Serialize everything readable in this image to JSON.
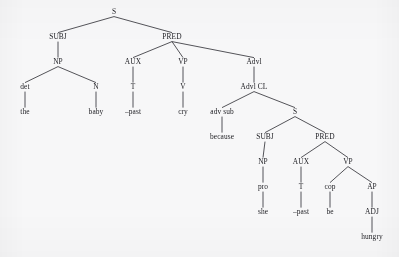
{
  "diagram": {
    "type": "constituency-tree",
    "background_color": "#f7f7f8",
    "line_color": "#2a2a30",
    "text_color": "#1d1d22",
    "width": 399,
    "height": 257,
    "nodes": [
      {
        "id": "s-main",
        "label": "S",
        "kind": "category",
        "x": 114,
        "y": 14
      },
      {
        "id": "subj-main",
        "label": "SUBJ",
        "kind": "category",
        "x": 58,
        "y": 39
      },
      {
        "id": "pred-main",
        "label": "PRED",
        "kind": "category",
        "x": 172,
        "y": 39
      },
      {
        "id": "np-main",
        "label": "NP",
        "kind": "category",
        "x": 58,
        "y": 64
      },
      {
        "id": "aux-main",
        "label": "AUX",
        "kind": "category",
        "x": 133,
        "y": 64
      },
      {
        "id": "vp-main",
        "label": "VP",
        "kind": "category",
        "x": 183,
        "y": 64
      },
      {
        "id": "advl-main",
        "label": "Advl",
        "kind": "category",
        "x": 254,
        "y": 64
      },
      {
        "id": "det-main",
        "label": "det",
        "kind": "category",
        "x": 25,
        "y": 89
      },
      {
        "id": "n-main",
        "label": "N",
        "kind": "category",
        "x": 96,
        "y": 89
      },
      {
        "id": "t-main",
        "label": "T",
        "kind": "category",
        "x": 133,
        "y": 89
      },
      {
        "id": "v-main",
        "label": "V",
        "kind": "category",
        "x": 183,
        "y": 89
      },
      {
        "id": "advlcl",
        "label": "Advl CL",
        "kind": "category",
        "x": 254,
        "y": 89
      },
      {
        "id": "the",
        "label": "the",
        "kind": "lexical",
        "x": 25,
        "y": 114
      },
      {
        "id": "baby",
        "label": "baby",
        "kind": "lexical",
        "x": 96,
        "y": 114
      },
      {
        "id": "past1",
        "label": "–past",
        "kind": "lexical",
        "x": 133,
        "y": 114
      },
      {
        "id": "cry",
        "label": "cry",
        "kind": "lexical",
        "x": 183,
        "y": 114
      },
      {
        "id": "advsub",
        "label": "adv sub",
        "kind": "category",
        "x": 222,
        "y": 114
      },
      {
        "id": "s-sub",
        "label": "S",
        "kind": "category",
        "x": 295,
        "y": 114
      },
      {
        "id": "because",
        "label": "because",
        "kind": "lexical",
        "x": 222,
        "y": 139
      },
      {
        "id": "subj-sub",
        "label": "SUBJ",
        "kind": "category",
        "x": 265,
        "y": 139
      },
      {
        "id": "pred-sub",
        "label": "PRED",
        "kind": "category",
        "x": 325,
        "y": 139
      },
      {
        "id": "np-sub",
        "label": "NP",
        "kind": "category",
        "x": 263,
        "y": 164
      },
      {
        "id": "aux-sub",
        "label": "AUX",
        "kind": "category",
        "x": 301,
        "y": 164
      },
      {
        "id": "vp-sub",
        "label": "VP",
        "kind": "category",
        "x": 348,
        "y": 164
      },
      {
        "id": "pro-sub",
        "label": "pro",
        "kind": "category",
        "x": 263,
        "y": 189
      },
      {
        "id": "t-sub",
        "label": "T",
        "kind": "category",
        "x": 301,
        "y": 189
      },
      {
        "id": "cop-sub",
        "label": "cop",
        "kind": "category",
        "x": 330,
        "y": 189
      },
      {
        "id": "ap-sub",
        "label": "AP",
        "kind": "category",
        "x": 372,
        "y": 189
      },
      {
        "id": "she",
        "label": "she",
        "kind": "lexical",
        "x": 263,
        "y": 214
      },
      {
        "id": "past2",
        "label": "–past",
        "kind": "lexical",
        "x": 301,
        "y": 214
      },
      {
        "id": "be",
        "label": "be",
        "kind": "lexical",
        "x": 330,
        "y": 214
      },
      {
        "id": "adj-sub",
        "label": "ADJ",
        "kind": "category",
        "x": 372,
        "y": 214
      },
      {
        "id": "hungry",
        "label": "hungry",
        "kind": "lexical",
        "x": 372,
        "y": 239
      }
    ],
    "edges": [
      {
        "from": "s-main",
        "to": "subj-main"
      },
      {
        "from": "s-main",
        "to": "pred-main"
      },
      {
        "from": "subj-main",
        "to": "np-main"
      },
      {
        "from": "pred-main",
        "to": "aux-main"
      },
      {
        "from": "pred-main",
        "to": "vp-main"
      },
      {
        "from": "pred-main",
        "to": "advl-main"
      },
      {
        "from": "np-main",
        "to": "det-main"
      },
      {
        "from": "np-main",
        "to": "n-main"
      },
      {
        "from": "aux-main",
        "to": "t-main"
      },
      {
        "from": "vp-main",
        "to": "v-main"
      },
      {
        "from": "advl-main",
        "to": "advlcl"
      },
      {
        "from": "det-main",
        "to": "the"
      },
      {
        "from": "n-main",
        "to": "baby"
      },
      {
        "from": "t-main",
        "to": "past1"
      },
      {
        "from": "v-main",
        "to": "cry"
      },
      {
        "from": "advlcl",
        "to": "advsub"
      },
      {
        "from": "advlcl",
        "to": "s-sub"
      },
      {
        "from": "advsub",
        "to": "because"
      },
      {
        "from": "s-sub",
        "to": "subj-sub"
      },
      {
        "from": "s-sub",
        "to": "pred-sub"
      },
      {
        "from": "subj-sub",
        "to": "np-sub"
      },
      {
        "from": "pred-sub",
        "to": "aux-sub"
      },
      {
        "from": "pred-sub",
        "to": "vp-sub"
      },
      {
        "from": "np-sub",
        "to": "pro-sub"
      },
      {
        "from": "aux-sub",
        "to": "t-sub"
      },
      {
        "from": "vp-sub",
        "to": "cop-sub"
      },
      {
        "from": "vp-sub",
        "to": "ap-sub"
      },
      {
        "from": "pro-sub",
        "to": "she"
      },
      {
        "from": "t-sub",
        "to": "past2"
      },
      {
        "from": "cop-sub",
        "to": "be"
      },
      {
        "from": "ap-sub",
        "to": "adj-sub"
      },
      {
        "from": "adj-sub",
        "to": "hungry"
      }
    ]
  }
}
